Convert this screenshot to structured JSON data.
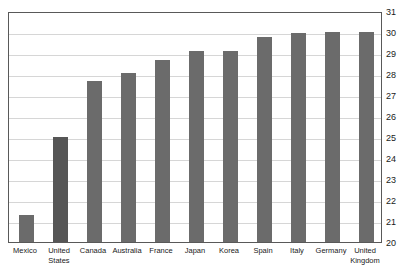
{
  "chart_data": {
    "type": "bar",
    "title": "",
    "subtitle": "",
    "xlabel": "",
    "ylabel": "",
    "ylim": [
      20,
      31
    ],
    "ytick_step": 1,
    "yticks": [
      31,
      30,
      29,
      28,
      27,
      26,
      25,
      24,
      23,
      22,
      21,
      20
    ],
    "grid": true,
    "legend": false,
    "legend_position": "none",
    "categories": [
      "Mexico",
      "United States",
      "Canada",
      "Australia",
      "France",
      "Japan",
      "Korea",
      "Spain",
      "Italy",
      "Germany",
      "United Kingdom"
    ],
    "category_lines": [
      [
        "Mexico"
      ],
      [
        "United",
        "States"
      ],
      [
        "Canada"
      ],
      [
        "Australia"
      ],
      [
        "France"
      ],
      [
        "Japan"
      ],
      [
        "Korea"
      ],
      [
        "Spain"
      ],
      [
        "Italy"
      ],
      [
        "Germany"
      ],
      [
        "United",
        "Kingdom"
      ]
    ],
    "values": [
      21.3,
      25.0,
      27.65,
      28.05,
      28.65,
      29.1,
      29.1,
      29.75,
      29.95,
      30.0,
      30.0
    ],
    "highlight_index": 1,
    "colors": {
      "bar": "#6b6b6b",
      "bar_highlight": "#565656",
      "gridline": "#d6d6d6",
      "frame": "#595959",
      "text": "#1a1a1a",
      "background": "#ffffff"
    }
  }
}
